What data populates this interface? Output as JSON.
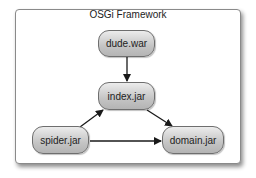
{
  "frame": {
    "title": "OSGi Framework"
  },
  "nodes": [
    {
      "id": "dude",
      "label": "dude.war",
      "x": 98,
      "y": 30,
      "w": 57,
      "h": 27
    },
    {
      "id": "index",
      "label": "index.jar",
      "x": 98,
      "y": 82,
      "w": 57,
      "h": 28
    },
    {
      "id": "spider",
      "label": "spider.jar",
      "x": 32,
      "y": 126,
      "w": 57,
      "h": 28
    },
    {
      "id": "domain",
      "label": "domain.jar",
      "x": 162,
      "y": 126,
      "w": 62,
      "h": 28
    }
  ],
  "edges": [
    {
      "from": "dude.war",
      "to": "index.jar"
    },
    {
      "from": "spider.jar",
      "to": "index.jar"
    },
    {
      "from": "index.jar",
      "to": "domain.jar"
    },
    {
      "from": "spider.jar",
      "to": "domain.jar"
    }
  ],
  "colors": {
    "node_border": "#6e6e6e",
    "edge": "#1a1a1a",
    "frame_border": "#8a8a8a"
  }
}
